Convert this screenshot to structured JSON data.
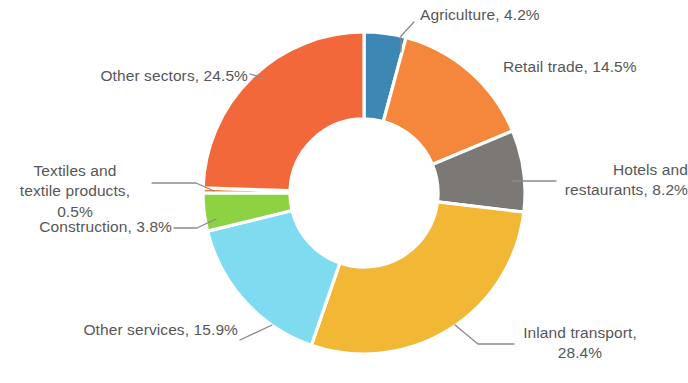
{
  "chart_data": {
    "type": "pie",
    "variant": "donut",
    "title": "",
    "subtitle": "",
    "xlabel": "",
    "ylabel": "",
    "units": "percent",
    "legend_position": "none",
    "grid": false,
    "label_format": "{name}, {value}%",
    "start_angle_deg": 0,
    "direction": "clockwise",
    "inner_radius_ratio": 0.46,
    "total": 100.0,
    "categories": [
      "Agriculture",
      "Retail trade",
      "Hotels and restaurants",
      "Inland transport",
      "Other services",
      "Construction",
      "Textiles and textile products",
      "Other sectors"
    ],
    "values": [
      4.2,
      14.5,
      8.2,
      28.4,
      15.9,
      3.8,
      0.5,
      24.5
    ],
    "colors": [
      "#3d87b5",
      "#f4873c",
      "#7b7875",
      "#f2b735",
      "#7fdbef",
      "#8dd243",
      "#f4873c",
      "#f2683a"
    ],
    "slices": [
      {
        "name": "Agriculture",
        "value": 4.2,
        "label": "Agriculture, 4.2%",
        "color": "#3d87b5"
      },
      {
        "name": "Retail trade",
        "value": 14.5,
        "label": "Retail trade, 14.5%",
        "color": "#f4873c"
      },
      {
        "name": "Hotels and restaurants",
        "value": 8.2,
        "label": "Hotels and\nrestaurants, 8.2%",
        "color": "#7b7875"
      },
      {
        "name": "Inland transport",
        "value": 28.4,
        "label": "Inland transport,\n28.4%",
        "color": "#f2b735"
      },
      {
        "name": "Other services",
        "value": 15.9,
        "label": "Other services, 15.9%",
        "color": "#7fdbef"
      },
      {
        "name": "Construction",
        "value": 3.8,
        "label": "Construction, 3.8%",
        "color": "#8dd243"
      },
      {
        "name": "Textiles and textile products",
        "value": 0.5,
        "label": "Textiles and\ntextile products, 0.5%",
        "color": "#f4873c"
      },
      {
        "name": "Other sectors",
        "value": 24.5,
        "label": "Other sectors, 24.5%",
        "color": "#f2683a"
      }
    ]
  },
  "labels": {
    "agriculture": "Agriculture, 4.2%",
    "retail_trade": "Retail trade, 14.5%",
    "hotels_restaurants": "Hotels and\nrestaurants, 8.2%",
    "inland_transport": "Inland transport,\n28.4%",
    "other_services": "Other services, 15.9%",
    "construction": "Construction, 3.8%",
    "textiles": "Textiles and\ntextile products, 0.5%",
    "other_sectors": "Other sectors, 24.5%"
  },
  "style": {
    "background": "#ffffff",
    "text_color": "#56565a",
    "leader_line_color": "#8a8a8c",
    "separator_color": "#ffffff"
  }
}
